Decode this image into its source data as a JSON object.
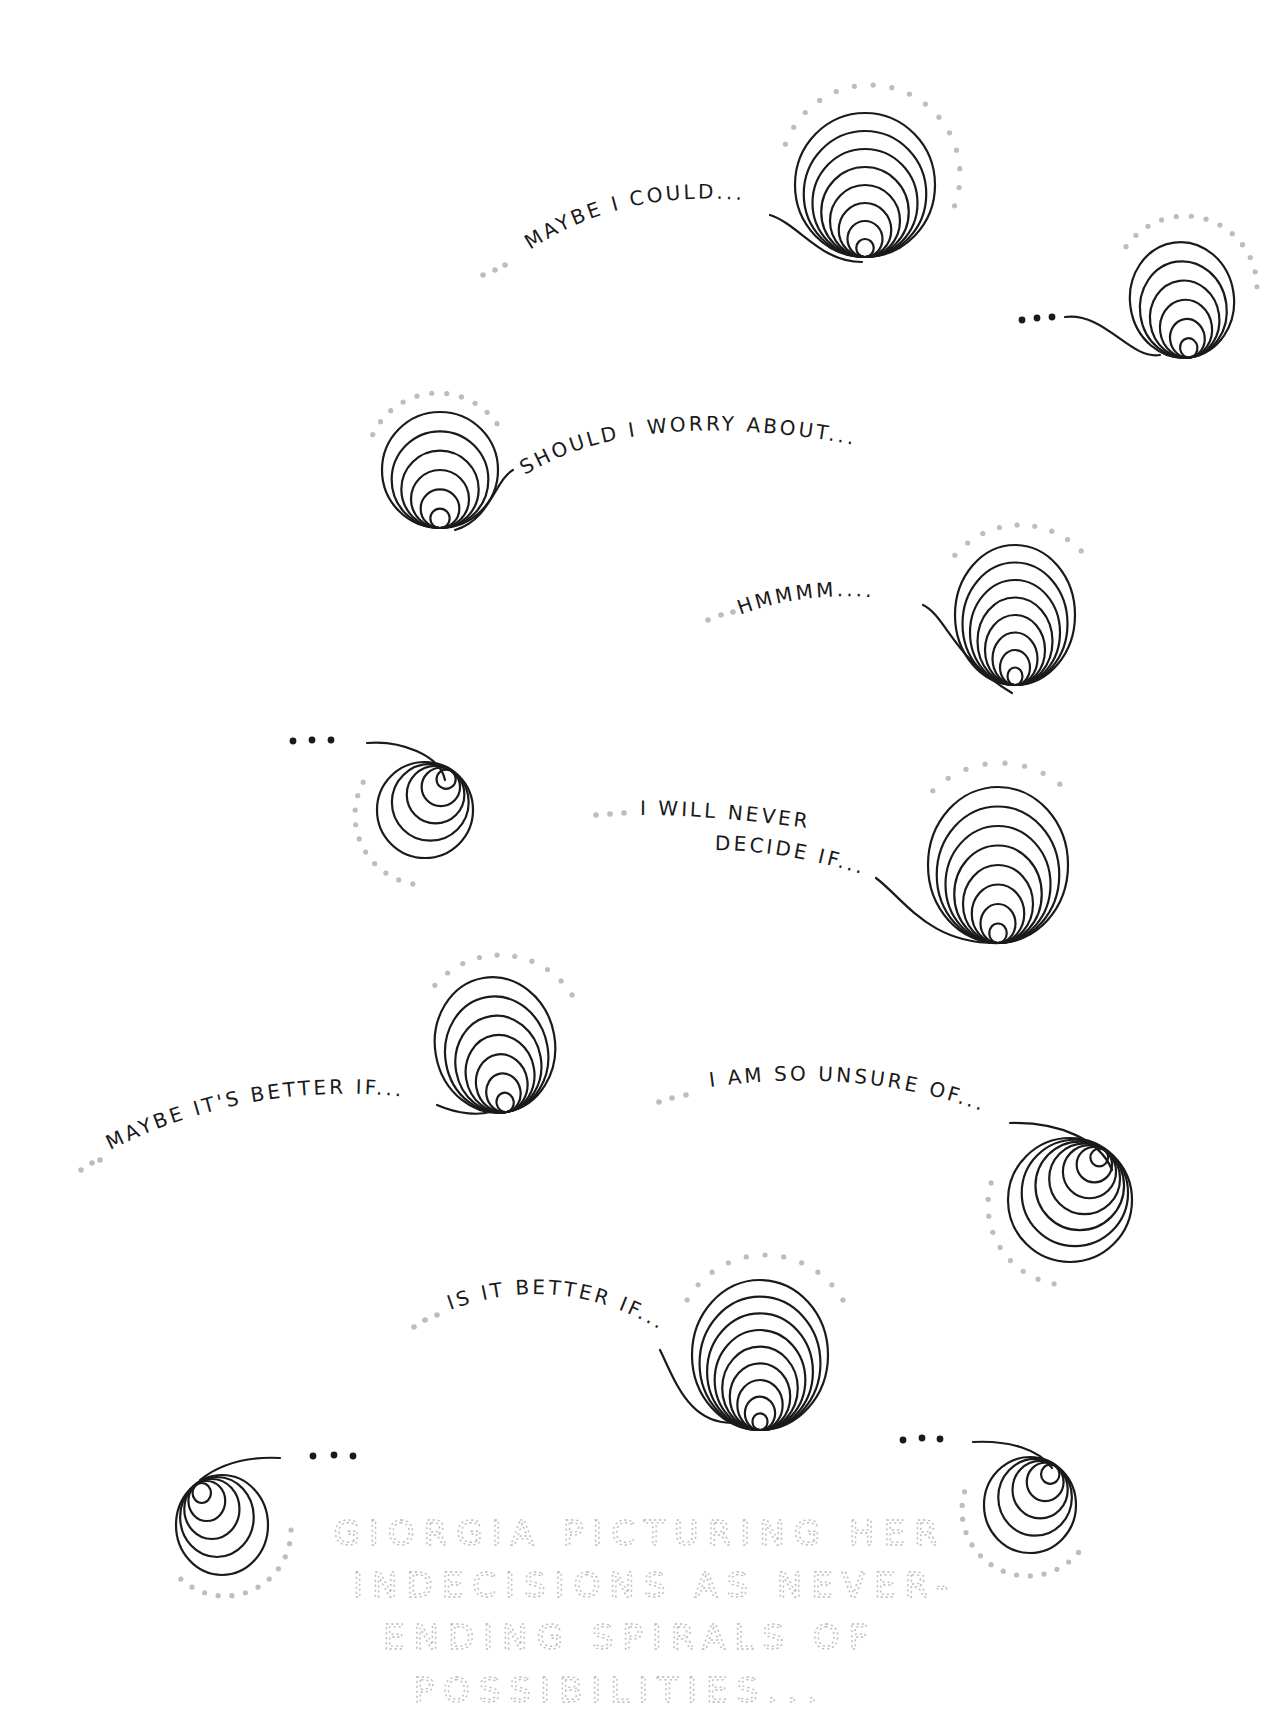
{
  "illustration": {
    "background": "#ffffff",
    "ink_color": "#1a1a1a",
    "dot_color": "#bdbdbd",
    "caption_color": "#b8b8b8"
  },
  "thoughts": [
    {
      "id": "maybe-i-could",
      "text": "MAYBE I COULD...",
      "spiral": {
        "cx": 865,
        "cy": 185,
        "rx": 70,
        "ry": 72,
        "rings": 8,
        "anchor": "bottom",
        "rot": 0
      },
      "tail": "M 770 215 C 800 225, 820 262, 862 262",
      "text_path": "M 530 250 Q 620 190, 740 200",
      "lead_dots": [
        [
          505,
          265
        ],
        [
          495,
          270
        ],
        [
          483,
          275
        ]
      ],
      "halo": {
        "cx": 870,
        "cy": 175,
        "r": 90,
        "start": 200,
        "end": 380
      }
    },
    {
      "id": "ellipsis-top-right",
      "text": "",
      "spiral": {
        "cx": 1182,
        "cy": 300,
        "rx": 52,
        "ry": 58,
        "rings": 6,
        "anchor": "bottom",
        "rot": -8
      },
      "tail": "M 1065 317 C 1105 312, 1130 360, 1160 355",
      "text_path": "",
      "black_dots": [
        [
          1022,
          320
        ],
        [
          1037,
          318
        ],
        [
          1052,
          317
        ]
      ],
      "halo": {
        "cx": 1185,
        "cy": 288,
        "r": 72,
        "start": 215,
        "end": 365
      }
    },
    {
      "id": "should-i-worry",
      "text": "SHOULD I WORRY ABOUT...?",
      "spiral": {
        "cx": 440,
        "cy": 470,
        "rx": 58,
        "ry": 58,
        "rings": 6,
        "anchor": "bottom",
        "rot": 0
      },
      "tail": "M 513 470 C 495 480, 490 520, 455 530",
      "text_path": "M 525 475 Q 640 405, 855 445",
      "lead_dots": [],
      "halo": {
        "cx": 438,
        "cy": 465,
        "r": 72,
        "start": 205,
        "end": 330
      }
    },
    {
      "id": "hmmmm",
      "text": "HMMMM....",
      "spiral": {
        "cx": 1015,
        "cy": 615,
        "rx": 60,
        "ry": 70,
        "rings": 8,
        "anchor": "bottom",
        "rot": 0
      },
      "tail": "M 923 605 C 945 615, 955 660, 1012 693",
      "text_path": "M 740 615 Q 820 585, 915 603",
      "lead_dots": [
        [
          708,
          620
        ],
        [
          721,
          615
        ],
        [
          733,
          612
        ]
      ],
      "halo": {
        "cx": 1020,
        "cy": 610,
        "r": 85,
        "start": 220,
        "end": 320
      }
    },
    {
      "id": "ellipsis-left",
      "text": "",
      "spiral": {
        "cx": 425,
        "cy": 810,
        "rx": 48,
        "ry": 48,
        "rings": 5,
        "anchor": "top-right",
        "rot": 0
      },
      "tail": "M 367 743 C 400 740, 440 755, 445 780",
      "text_path": "",
      "black_dots": [
        [
          293,
          741
        ],
        [
          312,
          740
        ],
        [
          331,
          740
        ]
      ],
      "halo": {
        "cx": 425,
        "cy": 815,
        "r": 70,
        "start": 100,
        "end": 210
      }
    },
    {
      "id": "i-will-never-decide",
      "text": "I WILL NEVER",
      "text2": "DECIDE IF...",
      "spiral": {
        "cx": 998,
        "cy": 865,
        "rx": 70,
        "ry": 78,
        "rings": 8,
        "anchor": "bottom",
        "rot": 0
      },
      "tail": "M 876 878 C 905 900, 930 945, 1000 943",
      "text_path": "M 640 815 Q 720 815, 820 830",
      "text_path2": "M 715 850 Q 790 850, 880 880",
      "lead_dots": [
        [
          596,
          815
        ],
        [
          610,
          814
        ],
        [
          624,
          813
        ]
      ],
      "halo": {
        "cx": 1000,
        "cy": 858,
        "r": 95,
        "start": 225,
        "end": 310
      }
    },
    {
      "id": "maybe-its-better-if",
      "text": "MAYBE IT'S BETTER IF...",
      "spiral": {
        "cx": 495,
        "cy": 1045,
        "rx": 60,
        "ry": 68,
        "rings": 7,
        "anchor": "bottom",
        "rot": -10
      },
      "tail": "M 437 1105 C 460 1115, 480 1115, 490 1112",
      "text_path": "M 110 1150 Q 260 1075, 430 1100",
      "lead_dots": [
        [
          81,
          1170
        ],
        [
          92,
          1163
        ],
        [
          100,
          1160
        ]
      ],
      "halo": {
        "cx": 500,
        "cy": 1040,
        "r": 85,
        "start": 220,
        "end": 330
      }
    },
    {
      "id": "i-am-so-unsure",
      "text": "I AM SO UNSURE OF...",
      "spiral": {
        "cx": 1070,
        "cy": 1200,
        "rx": 62,
        "ry": 62,
        "rings": 7,
        "anchor": "top-right",
        "rot": 0
      },
      "tail": "M 1010 1123 C 1060 1122, 1100 1140, 1112 1170",
      "text_path": "M 710 1087 Q 870 1065, 1000 1118",
      "lead_dots": [
        [
          659,
          1102
        ],
        [
          672,
          1098
        ],
        [
          686,
          1095
        ]
      ],
      "halo": {
        "cx": 1068,
        "cy": 1205,
        "r": 80,
        "start": 100,
        "end": 200
      }
    },
    {
      "id": "is-it-better-if",
      "text": "IS IT BETTER IF...",
      "spiral": {
        "cx": 760,
        "cy": 1355,
        "rx": 68,
        "ry": 75,
        "rings": 9,
        "anchor": "bottom",
        "rot": 0
      },
      "tail": "M 660 1350 C 675 1380, 690 1430, 742 1422",
      "text_path": "M 450 1310 Q 560 1270, 660 1330",
      "lead_dots": [
        [
          414,
          1327
        ],
        [
          425,
          1320
        ],
        [
          437,
          1315
        ]
      ],
      "halo": {
        "cx": 765,
        "cy": 1345,
        "r": 90,
        "start": 210,
        "end": 330
      }
    },
    {
      "id": "ellipsis-bottom-left",
      "text": "",
      "spiral": {
        "cx": 222,
        "cy": 1525,
        "rx": 46,
        "ry": 50,
        "rings": 5,
        "anchor": "top-left",
        "rot": 0
      },
      "tail": "M 280 1458 C 240 1456, 215 1468, 200 1480",
      "text_path": "",
      "black_dots": [
        [
          313,
          1456
        ],
        [
          334,
          1455
        ],
        [
          353,
          1456
        ]
      ],
      "halo": {
        "cx": 225,
        "cy": 1530,
        "r": 66,
        "start": 0,
        "end": 140
      }
    },
    {
      "id": "ellipsis-bottom-right",
      "text": "",
      "spiral": {
        "cx": 1030,
        "cy": 1505,
        "rx": 46,
        "ry": 48,
        "rings": 5,
        "anchor": "top-right",
        "rot": 0
      },
      "tail": "M 973 1442 C 1010 1440, 1040 1450, 1052 1468",
      "text_path": "",
      "black_dots": [
        [
          903,
          1440
        ],
        [
          922,
          1438
        ],
        [
          940,
          1439
        ]
      ],
      "halo": {
        "cx": 1028,
        "cy": 1510,
        "r": 66,
        "start": 40,
        "end": 200
      }
    }
  ],
  "caption": {
    "lines": [
      "GIORGIA PICTURING HER",
      "INDECISIONS AS NEVER-",
      "ENDING SPIRALS OF",
      "POSSIBILITIES..."
    ]
  }
}
